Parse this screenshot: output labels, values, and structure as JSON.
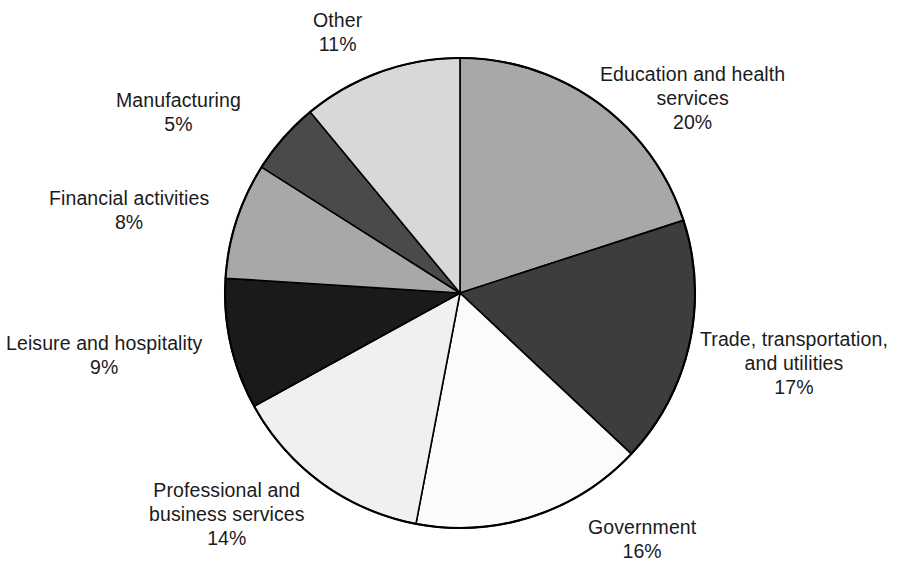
{
  "chart_data": {
    "type": "pie",
    "title": "",
    "subtitle": "",
    "xlabel": "",
    "ylabel": "",
    "legend_position": "none",
    "grid": false,
    "labels_outside": true,
    "start_angle_deg": 0,
    "direction": "clockwise",
    "categories": [
      "Education and health services",
      "Trade, transportation, and utilities",
      "Government",
      "Professional and business services",
      "Leisure and hospitality",
      "Financial activities",
      "Manufacturing",
      "Other"
    ],
    "values": [
      20,
      17,
      16,
      14,
      9,
      8,
      5,
      11
    ],
    "value_labels": [
      "20%",
      "17%",
      "16%",
      "14%",
      "9%",
      "8%",
      "5%",
      "11%"
    ],
    "units": "percent",
    "total": 100,
    "colors": [
      "#a8a8a8",
      "#3d3d3d",
      "#fbfbfb",
      "#f0f0f0",
      "#1a1a1a",
      "#a8a8a8",
      "#4a4a4a",
      "#d8d8d8"
    ]
  },
  "chart": {
    "center_x": 460,
    "center_y": 293,
    "radius": 235,
    "outline_color": "#000000",
    "background": "#ffffff"
  },
  "labels": {
    "education": {
      "line1": "Education and health",
      "line2": "services",
      "value": "20%"
    },
    "trade": {
      "line1": "Trade, transportation,",
      "line2": "and utilities",
      "value": "17%"
    },
    "government": {
      "line1": "Government",
      "line2": "",
      "value": "16%"
    },
    "professional": {
      "line1": "Professional and",
      "line2": "business services",
      "value": "14%"
    },
    "leisure": {
      "line1": "Leisure and hospitality",
      "line2": "",
      "value": "9%"
    },
    "financial": {
      "line1": "Financial activities",
      "line2": "",
      "value": "8%"
    },
    "manufacturing": {
      "line1": "Manufacturing",
      "line2": "",
      "value": "5%"
    },
    "other": {
      "line1": "Other",
      "line2": "",
      "value": "11%"
    }
  }
}
